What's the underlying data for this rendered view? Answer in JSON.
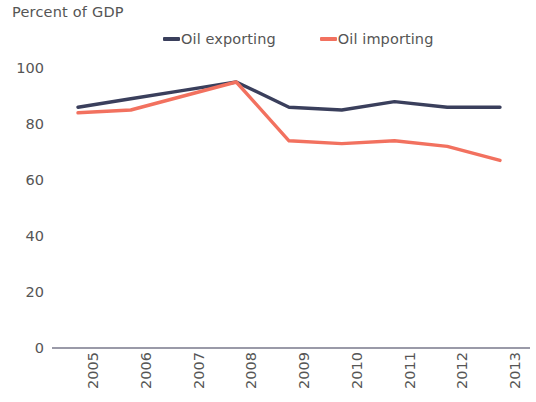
{
  "chart": {
    "title": "Percent of GDP"
  },
  "legend": {
    "position": "top-center",
    "items": [
      {
        "label": "Oil exporting",
        "color": "#3a3f5c",
        "swatch": "line-swatch"
      },
      {
        "label": "Oil importing",
        "color": "#f2715f",
        "swatch": "line-swatch"
      }
    ]
  },
  "axes": {
    "y_ticks": [
      "0",
      "20",
      "40",
      "60",
      "80",
      "100"
    ],
    "x_ticks": [
      "2005",
      "2006",
      "2007",
      "2008",
      "2009",
      "2010",
      "2011",
      "2012",
      "2013"
    ]
  },
  "chart_data": {
    "type": "line",
    "title": "Percent of GDP",
    "xlabel": "",
    "ylabel": "Percent of GDP",
    "ylim": [
      0,
      100
    ],
    "yticks": [
      0,
      20,
      40,
      60,
      80,
      100
    ],
    "grid": false,
    "legend_position": "top-center",
    "x": [
      2005,
      2006,
      2007,
      2008,
      2009,
      2010,
      2011,
      2012,
      2013
    ],
    "categories": [
      "2005",
      "2006",
      "2007",
      "2008",
      "2009",
      "2010",
      "2011",
      "2012",
      "2013"
    ],
    "series": [
      {
        "name": "Oil exporting",
        "color": "#3a3f5c",
        "values": [
          86,
          89,
          92,
          95,
          86,
          85,
          88,
          86,
          86
        ]
      },
      {
        "name": "Oil importing",
        "color": "#f2715f",
        "values": [
          84,
          85,
          90,
          95,
          74,
          73,
          74,
          72,
          67
        ]
      }
    ]
  }
}
